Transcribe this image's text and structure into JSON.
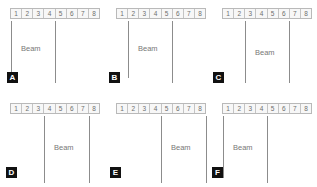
{
  "figure": {
    "ruler_labels": [
      "1",
      "2",
      "3",
      "4",
      "5",
      "6",
      "7",
      "8"
    ],
    "beam_text": "Beam",
    "colors": {
      "background": "#ffffff",
      "ruler_fill": "#f7f7f7",
      "ruler_border": "#b9b9b9",
      "ruler_text": "#6e6e6e",
      "support_line": "#8c8c8c",
      "beam_text": "#777777",
      "badge_background": "#111111",
      "badge_text": "#ffffff"
    },
    "panels": [
      {
        "id": "A",
        "label": "A",
        "beam_text": "Beam",
        "ruler_labels": [
          "1",
          "2",
          "3",
          "4",
          "5",
          "6",
          "7",
          "8"
        ],
        "support_positions": [
          0,
          4
        ],
        "support_descriptions": [
          "left edge of cell 1",
          "left edge of cell 5"
        ],
        "beam_label_position": "between supports"
      },
      {
        "id": "B",
        "label": "B",
        "beam_text": "Beam",
        "ruler_labels": [
          "1",
          "2",
          "3",
          "4",
          "5",
          "6",
          "7",
          "8"
        ],
        "support_positions": [
          1,
          5
        ],
        "support_descriptions": [
          "boundary of cells 1 and 2",
          "boundary of cells 5 and 6"
        ],
        "beam_label_position": "between supports"
      },
      {
        "id": "C",
        "label": "C",
        "beam_text": "Beam",
        "ruler_labels": [
          "1",
          "2",
          "3",
          "4",
          "5",
          "6",
          "7",
          "8"
        ],
        "support_positions": [
          2,
          6
        ],
        "support_descriptions": [
          "boundary of cells 2 and 3",
          "boundary of cells 6 and 7"
        ],
        "beam_label_position": "between supports"
      },
      {
        "id": "D",
        "label": "D",
        "beam_text": "Beam",
        "ruler_labels": [
          "1",
          "2",
          "3",
          "4",
          "5",
          "6",
          "7",
          "8"
        ],
        "support_positions": [
          3,
          7
        ],
        "support_descriptions": [
          "boundary of cells 3 and 4",
          "boundary of cells 7 and 8"
        ],
        "beam_label_position": "between supports"
      },
      {
        "id": "E",
        "label": "E",
        "beam_text": "Beam",
        "ruler_labels": [
          "1",
          "2",
          "3",
          "4",
          "5",
          "6",
          "7",
          "8"
        ],
        "support_positions": [
          4,
          8
        ],
        "support_descriptions": [
          "boundary of cells 4 and 5",
          "right edge of cell 8"
        ],
        "beam_label_position": "between supports"
      },
      {
        "id": "F",
        "label": "F",
        "beam_text": "Beam",
        "ruler_labels": [
          "1",
          "2",
          "3",
          "4",
          "5",
          "6",
          "7",
          "8"
        ],
        "support_positions": [
          0,
          4
        ],
        "support_descriptions": [
          "left edge of cell 1",
          "left edge of cell 5"
        ],
        "beam_label_position": "between supports"
      }
    ]
  }
}
